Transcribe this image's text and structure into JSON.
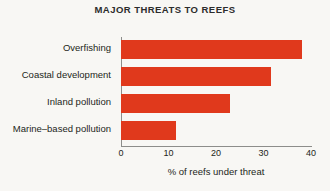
{
  "chart_data": {
    "type": "bar",
    "orientation": "horizontal",
    "title": "MAJOR THREATS TO REEFS",
    "xlabel": "% of reefs under threat",
    "ylabel": "",
    "categories": [
      "Overfishing",
      "Coastal development",
      "Inland pollution",
      "Marine–based pollution"
    ],
    "values": [
      38,
      31.5,
      23,
      11.5
    ],
    "xlim": [
      0,
      40
    ],
    "xticks": [
      0,
      10,
      20,
      30,
      40
    ],
    "xtick_labels": [
      "0",
      "10",
      "20",
      "30",
      "40"
    ],
    "grid": false,
    "legend": null,
    "bar_color": "#e0391c",
    "background_color": "#f8f7f4",
    "text_color": "#231f20"
  },
  "figure": {
    "title": "MAJOR THREATS TO REEFS",
    "axis_label_x": "% of reefs under threat"
  },
  "ticks": {
    "t0": "0",
    "t1": "10",
    "t2": "20",
    "t3": "30",
    "t4": "40"
  },
  "labels": {
    "cat0": "Overfishing",
    "cat1": "Coastal development",
    "cat2": "Inland pollution",
    "cat3": "Marine–based pollution"
  }
}
